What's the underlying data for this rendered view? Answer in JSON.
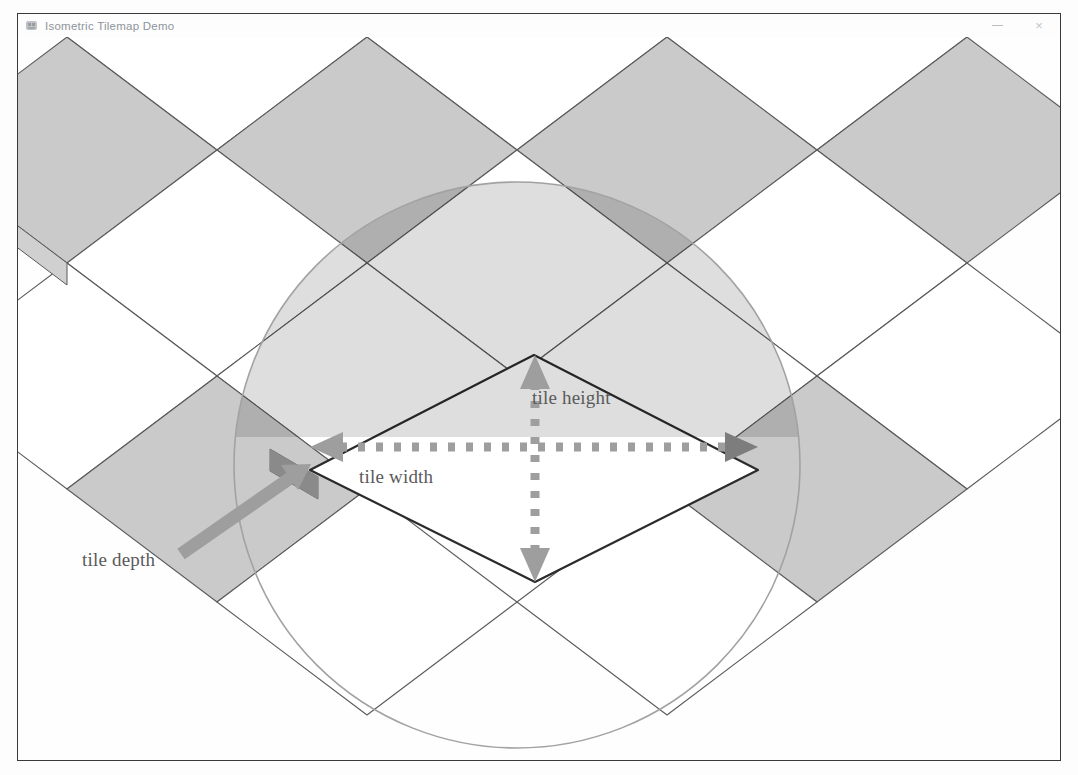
{
  "window": {
    "title": "Isometric Tilemap Demo",
    "icon": "app-icon",
    "controls": {
      "minimize": "–",
      "close": "×"
    }
  },
  "scene": {
    "name": "isometric-tilemap-canvas",
    "background_color": "#fefefe",
    "tile_fill_light": "#ffffff",
    "tile_fill_dark": "#c9c9c9",
    "tile_stroke": "#5a5a5a",
    "highlight_tile_fill": "#ffffff",
    "highlight_tile_stroke": "#2b2b2b",
    "depth_face_color": "#8f8f8f",
    "circle_stroke": "#9a9a9a",
    "circle_overlay_fill": "#b4b4b4",
    "annotation_color": "#9a9a9a",
    "tile_width_px": 300,
    "tile_height_px": 226,
    "tile_depth_px": 22
  },
  "annotations": {
    "tile_height": "tile height",
    "tile_width": "tile width",
    "tile_depth": "tile depth"
  }
}
